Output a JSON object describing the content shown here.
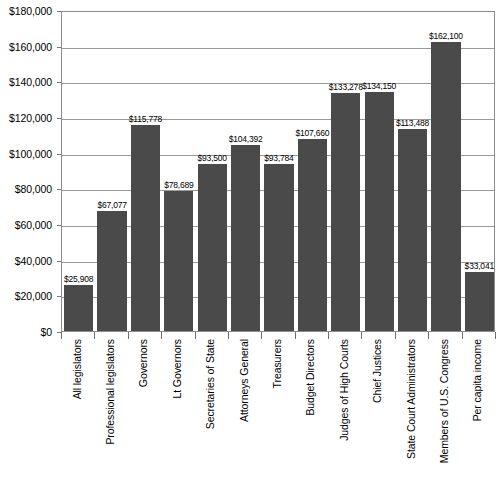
{
  "chart_data": {
    "type": "bar",
    "title": "",
    "subtitle": "",
    "xlabel": "",
    "ylabel": "",
    "ylim": [
      0,
      180000
    ],
    "ytick_step": 20000,
    "grid": true,
    "legend": false,
    "legend_position": "none",
    "orientation": "vertical",
    "bar_color": "#4a4a4a",
    "categories": [
      "All legislators",
      "Professional legislators",
      "Governors",
      "Lt Governors",
      "Secretaries of State",
      "Attorneys General",
      "Treasurers",
      "Budget Directors",
      "Judges of High Courts",
      "Chief Justices",
      "State Court Administrators",
      "Members of U.S. Congress",
      "Per capita income"
    ],
    "values": [
      25908,
      67077,
      115778,
      78689,
      93500,
      104392,
      93784,
      107660,
      133278,
      134150,
      113488,
      162100,
      33041
    ],
    "value_labels": [
      "$25,908",
      "$67,077",
      "$115,778",
      "$78,689",
      "$93,500",
      "$104,392",
      "$93,784",
      "$107,660",
      "$133,278",
      "$134,150",
      "$113,488",
      "$162,100",
      "$33,041"
    ],
    "ytick_labels": [
      "$0",
      "$20,000",
      "$40,000",
      "$60,000",
      "$80,000",
      "$100,000",
      "$120,000",
      "$140,000",
      "$160,000",
      "$180,000"
    ],
    "ytick_values": [
      0,
      20000,
      40000,
      60000,
      80000,
      100000,
      120000,
      140000,
      160000,
      180000
    ]
  }
}
